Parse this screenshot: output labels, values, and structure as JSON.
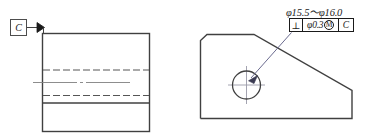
{
  "drawing": {
    "title": "Perpendicularity tolerance engineering drawing",
    "line_color": "#404040",
    "text_color": "#1a1a1a",
    "hidden_line_color": "#555555",
    "center_line_color": "#808080",
    "leader_color": "#6b6b8f"
  },
  "left_view": {
    "name": "front-view",
    "datum_symbol": {
      "label": "C",
      "name": "datum-feature-symbol-c"
    }
  },
  "right_view": {
    "name": "side-view",
    "dimension": {
      "text": "φ15.5～φ16.0"
    },
    "feature_control_frame": {
      "symbol": "⊥",
      "tolerance": "φ0.3",
      "material_modifier": "M",
      "datum": "C"
    }
  }
}
